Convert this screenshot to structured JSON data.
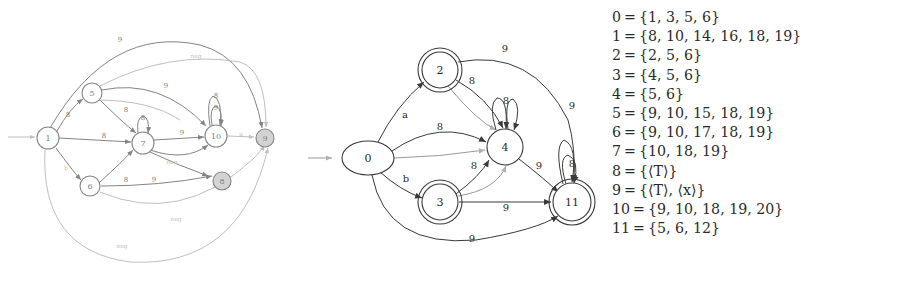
{
  "legend": {
    "rows": [
      {
        "index": "0",
        "eq": "=",
        "set": "{1, 3, 5, 6}"
      },
      {
        "index": "1",
        "eq": "=",
        "set": "{8, 10, 14, 16, 18, 19}"
      },
      {
        "index": "2",
        "eq": "=",
        "set": "{2, 5, 6}"
      },
      {
        "index": "3",
        "eq": "=",
        "set": "{4, 5, 6}"
      },
      {
        "index": "4",
        "eq": "=",
        "set": "{5, 6}"
      },
      {
        "index": "5",
        "eq": "=",
        "set": "{9, 10, 15, 18, 19}"
      },
      {
        "index": "6",
        "eq": "=",
        "set": "{9, 10, 17, 18, 19}"
      },
      {
        "index": "7",
        "eq": "=",
        "set": "{10, 18, 19}"
      },
      {
        "index": "8",
        "eq": "=",
        "set": "{⟨T⟩}"
      },
      {
        "index": "9",
        "eq": "=",
        "set": "{⟨T⟩, ⟨x⟩}"
      },
      {
        "index": "10",
        "eq": "=",
        "set": "{9, 10, 18, 19, 20}"
      },
      {
        "index": "11",
        "eq": "=",
        "set": "{5, 6, 12}"
      }
    ]
  },
  "left_automaton": {
    "nodes": [
      {
        "id": "n1",
        "label": "1",
        "x": 48,
        "y": 138,
        "r": 11,
        "shape": "circle",
        "shaded": false,
        "start": true
      },
      {
        "id": "n5",
        "label": "5",
        "x": 92,
        "y": 93,
        "r": 10,
        "shape": "circle",
        "shaded": false,
        "start": false
      },
      {
        "id": "n6",
        "label": "6",
        "x": 90,
        "y": 186,
        "r": 10,
        "shape": "circle",
        "shaded": false,
        "start": false
      },
      {
        "id": "n7",
        "label": "7",
        "x": 143,
        "y": 143,
        "r": 11,
        "shape": "circle",
        "shaded": false,
        "start": false
      },
      {
        "id": "n10",
        "label": "10",
        "x": 216,
        "y": 136,
        "r": 11,
        "shape": "circle",
        "shaded": false,
        "start": false
      },
      {
        "id": "n8",
        "label": "8",
        "x": 222,
        "y": 181,
        "r": 9,
        "shape": "circle",
        "shaded": true,
        "start": false
      },
      {
        "id": "n9",
        "label": "9",
        "x": 265,
        "y": 138,
        "r": 9,
        "shape": "circle",
        "shaded": true,
        "start": false
      }
    ],
    "edge_labels": [
      {
        "text": "9",
        "x": 120,
        "y": 40,
        "faint": false
      },
      {
        "text": "neg",
        "x": 196,
        "y": 55,
        "faint": true
      },
      {
        "text": "9",
        "x": 166,
        "y": 86,
        "faint": false
      },
      {
        "text": "8",
        "x": 68,
        "y": 115,
        "faint": false
      },
      {
        "text": "8",
        "x": 126,
        "y": 110,
        "faint": false
      },
      {
        "text": "8",
        "x": 104,
        "y": 136,
        "faint": false
      },
      {
        "text": "8",
        "x": 143,
        "y": 118,
        "faint": false
      },
      {
        "text": "8",
        "x": 216,
        "y": 96,
        "faint": false
      },
      {
        "text": "9",
        "x": 216,
        "y": 108,
        "faint": false
      },
      {
        "text": "9",
        "x": 182,
        "y": 133,
        "faint": false
      },
      {
        "text": "a",
        "x": 241,
        "y": 133,
        "faint": true
      },
      {
        "text": "neg",
        "x": 172,
        "y": 161,
        "faint": true
      },
      {
        "text": "b",
        "x": 66,
        "y": 167,
        "faint": true
      },
      {
        "text": "8",
        "x": 126,
        "y": 180,
        "faint": false
      },
      {
        "text": "9",
        "x": 154,
        "y": 180,
        "faint": false
      },
      {
        "text": "neg",
        "x": 176,
        "y": 218,
        "faint": true
      },
      {
        "text": "neg",
        "x": 122,
        "y": 245,
        "faint": true
      }
    ]
  },
  "right_automaton": {
    "nodes": [
      {
        "id": "r0",
        "label": "0",
        "cx": 68,
        "cy": 158,
        "rx": 26,
        "ry": 17,
        "shape": "ellipse",
        "accepting": false,
        "start": true
      },
      {
        "id": "r2",
        "label": "2",
        "cx": 140,
        "cy": 70,
        "rx": 18,
        "ry": 18,
        "shape": "circle",
        "accepting": true,
        "start": false
      },
      {
        "id": "r3",
        "label": "3",
        "cx": 140,
        "cy": 202,
        "rx": 18,
        "ry": 18,
        "shape": "circle",
        "accepting": true,
        "start": false
      },
      {
        "id": "r4",
        "label": "4",
        "cx": 205,
        "cy": 147,
        "rx": 18,
        "ry": 18,
        "shape": "circle",
        "accepting": false,
        "start": false
      },
      {
        "id": "r11",
        "label": "11",
        "cx": 272,
        "cy": 202,
        "rx": 19,
        "ry": 19,
        "shape": "circle",
        "accepting": true,
        "start": false
      }
    ],
    "edge_labels": [
      {
        "text": "a",
        "x": 105,
        "y": 114
      },
      {
        "text": "b",
        "x": 106,
        "y": 178
      },
      {
        "text": "8",
        "x": 140,
        "y": 126
      },
      {
        "text": "8",
        "x": 172,
        "y": 80
      },
      {
        "text": "9",
        "x": 205,
        "y": 48
      },
      {
        "text": "8",
        "x": 206,
        "y": 100
      },
      {
        "text": "9",
        "x": 272,
        "y": 105
      },
      {
        "text": "8",
        "x": 272,
        "y": 163
      },
      {
        "text": "8",
        "x": 174,
        "y": 165
      },
      {
        "text": "9",
        "x": 239,
        "y": 165
      },
      {
        "text": "9",
        "x": 206,
        "y": 207
      },
      {
        "text": "9",
        "x": 172,
        "y": 238
      }
    ]
  }
}
